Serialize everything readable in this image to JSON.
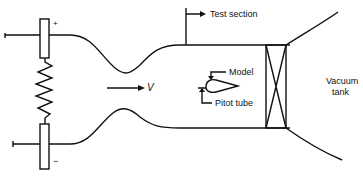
{
  "diagram": {
    "labels": {
      "plus": "+",
      "minus": "−",
      "velocity": "V",
      "test_section": "Test section",
      "model": "Model",
      "pitot_tube": "Pitot tube",
      "vacuum_tank_line1": "Vacuum",
      "vacuum_tank_line2": "tank"
    },
    "colors": {
      "stroke": "#111111",
      "background": "#ffffff"
    }
  }
}
